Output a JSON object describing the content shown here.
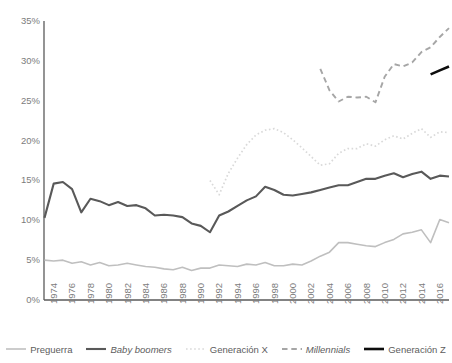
{
  "chart_data": {
    "type": "line",
    "title": "",
    "xlabel": "",
    "ylabel": "",
    "xlim": [
      1974,
      2018
    ],
    "ylim": [
      0,
      35
    ],
    "ytick_step": 5,
    "grid": false,
    "legend_position": "bottom",
    "ytick_labels": [
      "35%",
      "30%",
      "25%",
      "20%",
      "15%",
      "10%",
      "5%",
      "0%"
    ],
    "ytick_values": [
      35,
      30,
      25,
      20,
      15,
      10,
      5,
      0
    ],
    "xtick_labels": [
      "1974",
      "1976",
      "1978",
      "1980",
      "1982",
      "1984",
      "1986",
      "1988",
      "1990",
      "1992",
      "1994",
      "1996",
      "1998",
      "2000",
      "2002",
      "2004",
      "2006",
      "2008",
      "2010",
      "2012",
      "2014",
      "2016",
      "2018"
    ],
    "xtick_values": [
      1974,
      1976,
      1978,
      1980,
      1982,
      1984,
      1986,
      1988,
      1990,
      1992,
      1994,
      1996,
      1998,
      2000,
      2002,
      2004,
      2006,
      2008,
      2010,
      2012,
      2014,
      2016,
      2018
    ],
    "x": [
      1974,
      1975,
      1976,
      1977,
      1978,
      1979,
      1980,
      1981,
      1982,
      1983,
      1984,
      1985,
      1986,
      1987,
      1988,
      1989,
      1990,
      1991,
      1992,
      1993,
      1994,
      1995,
      1996,
      1997,
      1998,
      1999,
      2000,
      2001,
      2002,
      2003,
      2004,
      2005,
      2006,
      2007,
      2008,
      2009,
      2010,
      2011,
      2012,
      2013,
      2014,
      2015,
      2016,
      2017,
      2018
    ],
    "series": [
      {
        "name": "Preguerra",
        "style": "solid",
        "color": "#bfbfbf",
        "width": 1.6,
        "italic": false,
        "x": [
          1974,
          1975,
          1976,
          1977,
          1978,
          1979,
          1980,
          1981,
          1982,
          1983,
          1984,
          1985,
          1986,
          1987,
          1988,
          1989,
          1990,
          1991,
          1992,
          1993,
          1994,
          1995,
          1996,
          1997,
          1998,
          1999,
          2000,
          2001,
          2002,
          2003,
          2004,
          2005,
          2006,
          2007,
          2008,
          2009,
          2010,
          2011,
          2012,
          2013,
          2014,
          2015,
          2016,
          2017,
          2018
        ],
        "values": [
          5.0,
          4.9,
          5.0,
          4.6,
          4.8,
          4.4,
          4.7,
          4.3,
          4.4,
          4.6,
          4.4,
          4.2,
          4.1,
          3.9,
          3.8,
          4.1,
          3.7,
          4.0,
          4.0,
          4.4,
          4.3,
          4.2,
          4.5,
          4.4,
          4.7,
          4.3,
          4.3,
          4.5,
          4.4,
          4.9,
          5.5,
          6.0,
          7.2,
          7.2,
          7.0,
          6.8,
          6.7,
          7.2,
          7.6,
          8.3,
          8.5,
          8.8,
          7.2,
          10.1,
          9.7
        ]
      },
      {
        "name": "Baby boomers",
        "style": "solid",
        "color": "#595959",
        "width": 2.1,
        "italic": true,
        "x": [
          1974,
          1975,
          1976,
          1977,
          1978,
          1979,
          1980,
          1981,
          1982,
          1983,
          1984,
          1985,
          1986,
          1987,
          1988,
          1989,
          1990,
          1991,
          1992,
          1993,
          1994,
          1995,
          1996,
          1997,
          1998,
          1999,
          2000,
          2001,
          2002,
          2003,
          2004,
          2005,
          2006,
          2007,
          2008,
          2009,
          2010,
          2011,
          2012,
          2013,
          2014,
          2015,
          2016,
          2017,
          2018
        ],
        "values": [
          10.3,
          14.6,
          14.8,
          13.9,
          11.0,
          12.7,
          12.4,
          11.9,
          12.3,
          11.8,
          11.9,
          11.5,
          10.6,
          10.7,
          10.6,
          10.4,
          9.6,
          9.3,
          8.5,
          10.6,
          11.1,
          11.8,
          12.5,
          13.0,
          14.2,
          13.8,
          13.2,
          13.1,
          13.3,
          13.5,
          13.8,
          14.1,
          14.4,
          14.4,
          14.8,
          15.2,
          15.2,
          15.6,
          15.9,
          15.4,
          15.8,
          16.1,
          15.2,
          15.6,
          15.5
        ]
      },
      {
        "name": "Generación X",
        "style": "dotted",
        "color": "#d9d9d9",
        "width": 1.7,
        "italic": false,
        "x": [
          1992,
          1993,
          1994,
          1995,
          1996,
          1997,
          1998,
          1999,
          2000,
          2001,
          2002,
          2003,
          2004,
          2005,
          2006,
          2007,
          2008,
          2009,
          2010,
          2011,
          2012,
          2013,
          2014,
          2015,
          2016,
          2017,
          2018
        ],
        "values": [
          15.0,
          13.2,
          15.9,
          17.8,
          19.5,
          20.7,
          21.3,
          21.5,
          21.0,
          20.1,
          19.1,
          18.0,
          16.9,
          17.1,
          18.4,
          19.0,
          19.0,
          19.6,
          19.3,
          20.1,
          20.6,
          20.2,
          20.9,
          21.5,
          20.4,
          21.1,
          21.0
        ]
      },
      {
        "name": "Millennials",
        "style": "dashed",
        "color": "#a6a6a6",
        "width": 1.9,
        "italic": true,
        "x": [
          2004,
          2005,
          2006,
          2007,
          2008,
          2009,
          2010,
          2011,
          2012,
          2013,
          2014,
          2015,
          2016,
          2017,
          2018
        ],
        "values": [
          29.0,
          26.3,
          24.9,
          25.5,
          25.4,
          25.5,
          24.8,
          28.0,
          29.6,
          29.3,
          29.8,
          31.1,
          31.7,
          33.0,
          34.1
        ]
      },
      {
        "name": "Generación Z",
        "style": "solid",
        "color": "#0d0d0d",
        "width": 2.6,
        "italic": false,
        "x": [
          2016,
          2017,
          2018
        ],
        "values": [
          28.3,
          28.8,
          29.3
        ]
      }
    ]
  },
  "legend": {
    "items": [
      {
        "label": "Preguerra"
      },
      {
        "label": "Baby boomers"
      },
      {
        "label": "Generación X"
      },
      {
        "label": "Millennials"
      },
      {
        "label": "Generación Z"
      }
    ]
  }
}
